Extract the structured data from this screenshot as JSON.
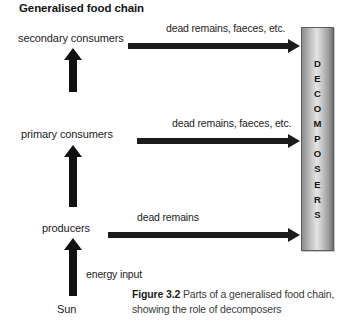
{
  "diagram": {
    "title": "Generalised food chain",
    "levels": [
      {
        "id": "secondary-consumers",
        "label": "secondary consumers"
      },
      {
        "id": "primary-consumers",
        "label": "primary consumers"
      },
      {
        "id": "producers",
        "label": "producers"
      },
      {
        "id": "sun",
        "label": "Sun"
      }
    ],
    "flow_notes": {
      "secondary_dead": "dead remains, faeces, etc.",
      "primary_dead": "dead remains, faeces, etc.",
      "producers_dead": "dead remains",
      "energy_input": "energy input"
    },
    "decomposers": {
      "label": "DECOMPOSERS",
      "letters": [
        "D",
        "E",
        "C",
        "O",
        "M",
        "P",
        "O",
        "S",
        "E",
        "R",
        "S"
      ]
    },
    "caption": {
      "number": "Figure 3.2",
      "text": " Parts of a generalised food chain, showing the role of decomposers"
    },
    "colors": {
      "arrow": "#1b1b1b",
      "text": "#1c1c1c",
      "column_border": "#5d5d5d",
      "caption": "#3a3a3a"
    }
  }
}
